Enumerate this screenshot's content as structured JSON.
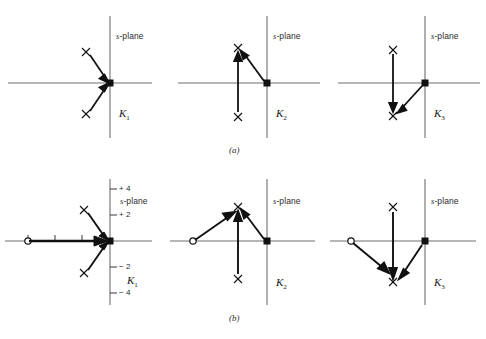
{
  "figure": {
    "type": "diagram",
    "row_labels": [
      {
        "id": "a",
        "text": "(a)"
      },
      {
        "id": "b",
        "text": "(b)"
      }
    ],
    "plane_label": "s-plane",
    "plane_label_italic_part": "s",
    "plane_label_rest": "-plane",
    "gain_labels": [
      "K",
      "K",
      "K",
      "K",
      "K",
      "K"
    ],
    "gain_subscripts": [
      "1",
      "2",
      "3",
      "1",
      "2",
      "3"
    ],
    "colors": {
      "axis": "#6e6e6e",
      "locus": "#111111",
      "text": "#2b2b2b",
      "background": "#ffffff"
    },
    "panels": [
      {
        "id": "a1",
        "row": "a",
        "gain": "K",
        "gain_sub": "1",
        "plane": "s-plane",
        "poles": [
          {
            "x": -2.2,
            "y": 2.0,
            "marker": "x"
          },
          {
            "x": -2.2,
            "y": -2.0,
            "marker": "x"
          }
        ],
        "zeros": [],
        "breakaway": {
          "x": 0,
          "y": 0,
          "marker": "filled-square"
        },
        "arrows": [
          {
            "from": [
              -2.2,
              2.0
            ],
            "to": [
              0,
              0
            ]
          },
          {
            "from": [
              -2.2,
              -2.0
            ],
            "to": [
              0,
              0
            ]
          }
        ],
        "axis_ticks": {
          "x": [],
          "y": []
        }
      },
      {
        "id": "a2",
        "row": "a",
        "gain": "K",
        "gain_sub": "2",
        "plane": "s-plane",
        "poles": [
          {
            "x": -1.6,
            "y": 2.0,
            "marker": "x"
          },
          {
            "x": -1.6,
            "y": -2.0,
            "marker": "x"
          }
        ],
        "zeros": [],
        "breakaway": {
          "x": 0,
          "y": 0,
          "marker": "filled-square"
        },
        "arrows": [
          {
            "from": [
              -1.6,
              -2.0
            ],
            "to": [
              -1.6,
              2.0
            ]
          },
          {
            "from": [
              0,
              0
            ],
            "to": [
              -1.6,
              2.0
            ]
          }
        ],
        "axis_ticks": {
          "x": [],
          "y": []
        }
      },
      {
        "id": "a3",
        "row": "a",
        "gain": "K",
        "gain_sub": "3",
        "plane": "s-plane",
        "poles": [
          {
            "x": -1.6,
            "y": 2.0,
            "marker": "x"
          },
          {
            "x": -1.6,
            "y": -2.0,
            "marker": "x"
          }
        ],
        "zeros": [],
        "breakaway": {
          "x": 0,
          "y": 0,
          "marker": "filled-square"
        },
        "arrows": [
          {
            "from": [
              -1.6,
              2.0
            ],
            "to": [
              -1.6,
              -2.0
            ]
          },
          {
            "from": [
              0,
              0
            ],
            "to": [
              -1.6,
              -2.0
            ]
          }
        ],
        "axis_ticks": {
          "x": [],
          "y": []
        }
      },
      {
        "id": "b1",
        "row": "b",
        "gain": "K",
        "gain_sub": "1",
        "plane": "s-plane",
        "poles": [
          {
            "x": -2.0,
            "y": 2.0,
            "marker": "x"
          },
          {
            "x": -2.0,
            "y": -2.0,
            "marker": "x"
          }
        ],
        "zeros": [
          {
            "x": -6.0,
            "y": 0,
            "marker": "o"
          }
        ],
        "breakaway": {
          "x": 0,
          "y": 0,
          "marker": "filled-square"
        },
        "arrows": [
          {
            "from": [
              -2.0,
              2.0
            ],
            "to": [
              0,
              0
            ]
          },
          {
            "from": [
              -2.0,
              -2.0
            ],
            "to": [
              0,
              0
            ]
          },
          {
            "from": [
              -6.0,
              0
            ],
            "to": [
              0,
              0
            ]
          }
        ],
        "axis_ticks": {
          "x": [
            {
              "value": -6,
              "label": "−6"
            },
            {
              "value": -4,
              "label": "−4"
            },
            {
              "value": -2,
              "label": "−2"
            },
            {
              "value": 0,
              "label": "0"
            }
          ],
          "y": [
            {
              "value": 4,
              "label": "+ 4"
            },
            {
              "value": 2,
              "label": "+ 2"
            },
            {
              "value": -2,
              "label": "− 2"
            },
            {
              "value": -4,
              "label": "− 4"
            }
          ]
        }
      },
      {
        "id": "b2",
        "row": "b",
        "gain": "K",
        "gain_sub": "2",
        "plane": "s-plane",
        "poles": [
          {
            "x": -2.0,
            "y": 2.0,
            "marker": "x"
          },
          {
            "x": -2.0,
            "y": -2.0,
            "marker": "x"
          }
        ],
        "zeros": [
          {
            "x": -6.0,
            "y": 0,
            "marker": "o"
          }
        ],
        "breakaway": {
          "x": 0,
          "y": 0,
          "marker": "filled-square"
        },
        "arrows": [
          {
            "from": [
              -2.0,
              -2.0
            ],
            "to": [
              -2.0,
              2.0
            ]
          },
          {
            "from": [
              0,
              0
            ],
            "to": [
              -2.0,
              2.0
            ]
          },
          {
            "from": [
              -6.0,
              0
            ],
            "to": [
              -2.0,
              2.0
            ]
          }
        ],
        "axis_ticks": {
          "x": [],
          "y": []
        }
      },
      {
        "id": "b3",
        "row": "b",
        "gain": "K",
        "gain_sub": "3",
        "plane": "s-plane",
        "poles": [
          {
            "x": -2.0,
            "y": 2.0,
            "marker": "x"
          },
          {
            "x": -2.0,
            "y": -2.0,
            "marker": "x"
          }
        ],
        "zeros": [
          {
            "x": -6.0,
            "y": 0,
            "marker": "o"
          }
        ],
        "breakaway": {
          "x": 0,
          "y": 0,
          "marker": "filled-square"
        },
        "arrows": [
          {
            "from": [
              -2.0,
              2.0
            ],
            "to": [
              -2.0,
              -2.0
            ]
          },
          {
            "from": [
              0,
              0
            ],
            "to": [
              -2.0,
              -2.0
            ]
          },
          {
            "from": [
              -6.0,
              0
            ],
            "to": [
              -2.0,
              -2.0
            ]
          }
        ],
        "axis_ticks": {
          "x": [],
          "y": []
        }
      }
    ]
  }
}
